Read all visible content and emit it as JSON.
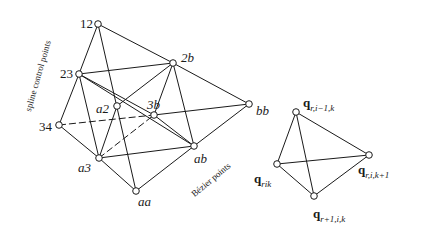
{
  "figure": {
    "left_tetrahedron": {
      "nodes": {
        "n12": {
          "label": "12",
          "x": 98,
          "y": 24
        },
        "n23": {
          "label": "23",
          "x": 79,
          "y": 74
        },
        "n2b": {
          "label": "2b",
          "x": 173,
          "y": 63
        },
        "na2": {
          "label": "a2",
          "x": 117,
          "y": 106
        },
        "n3b": {
          "label": "3b",
          "x": 154,
          "y": 115
        },
        "nbb": {
          "label": "bb",
          "x": 249,
          "y": 104
        },
        "n34": {
          "label": "34",
          "x": 59,
          "y": 125
        },
        "na3": {
          "label": "a3",
          "x": 99,
          "y": 158
        },
        "nab": {
          "label": "ab",
          "x": 194,
          "y": 146
        },
        "naa": {
          "label": "aa",
          "x": 136,
          "y": 191
        }
      },
      "side_labels": {
        "spline": "spline control points",
        "bezier": "Bézier points"
      }
    },
    "right_tetrahedron": {
      "top": {
        "base": "q",
        "sub": "r,i−1,k"
      },
      "left": {
        "base": "q",
        "sub": "rik"
      },
      "bottom": {
        "base": "q",
        "sub": "r+1,i,k"
      },
      "right": {
        "base": "q",
        "sub": "r,i,k+1"
      }
    }
  }
}
